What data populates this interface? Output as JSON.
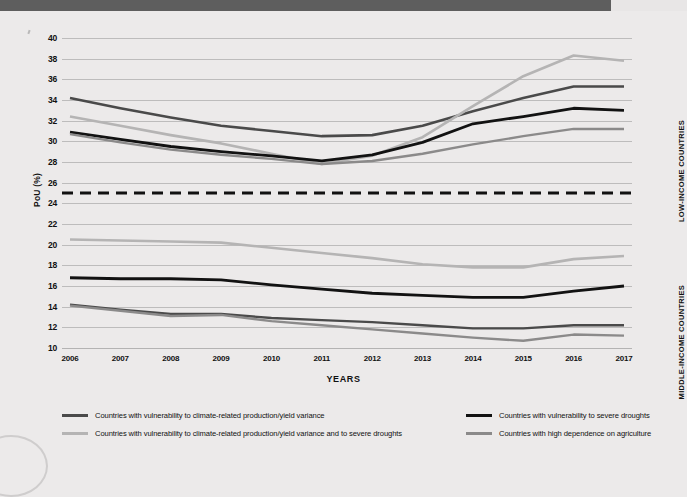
{
  "banner": {
    "color": "#5e5e5e",
    "width_px": 611
  },
  "axes": {
    "ylabel": "PoU (%)",
    "xlabel": "YEARS",
    "yticks": [
      10,
      12,
      14,
      16,
      18,
      20,
      22,
      24,
      26,
      28,
      30,
      32,
      34,
      36,
      38,
      40
    ],
    "ylim": [
      10,
      40
    ],
    "xticks": [
      "2006",
      "2007",
      "2008",
      "2009",
      "2010",
      "2011",
      "2012",
      "2013",
      "2014",
      "2015",
      "2016",
      "2017"
    ]
  },
  "panels": {
    "upper_label": "LOW-INCOME COUNTRIES",
    "lower_label": "MIDDLE-INCOME COUNTRIES",
    "divider_value": 25,
    "divider_style": "dashed"
  },
  "legend": [
    {
      "label": "Countries with vulnerability to climate-related production/yield variance",
      "color": "#4a4a4a",
      "column": "left",
      "row": 1
    },
    {
      "label": "Countries with vulnerability to climate-related production/yield variance and to severe droughts",
      "color": "#b5b4b4",
      "column": "left",
      "row": 2
    },
    {
      "label": "Countries with vulnerability to severe droughts",
      "color": "#121212",
      "column": "right",
      "row": 1
    },
    {
      "label": "Countries with high dependence on agriculture",
      "color": "#8b8a8a",
      "column": "right",
      "row": 2
    }
  ],
  "chart_data": {
    "type": "line",
    "title": "",
    "xlabel": "YEARS",
    "ylabel": "PoU (%)",
    "ylim": [
      10,
      40
    ],
    "grid": true,
    "legend_position": "bottom",
    "x": [
      "2006",
      "2007",
      "2008",
      "2009",
      "2010",
      "2011",
      "2012",
      "2013",
      "2014",
      "2015",
      "2016",
      "2017"
    ],
    "annotations": [
      {
        "text": "LOW-INCOME COUNTRIES",
        "position": "right-upper"
      },
      {
        "text": "MIDDLE-INCOME COUNTRIES",
        "position": "right-lower"
      },
      {
        "text": "dashed reference line",
        "y": 25
      }
    ],
    "series": [
      {
        "name": "Countries with vulnerability to climate-related production/yield variance",
        "group": "LOW-INCOME COUNTRIES",
        "color": "#4a4a4a",
        "width": 2.6,
        "values": [
          34.2,
          33.2,
          32.3,
          31.5,
          31.0,
          30.5,
          30.6,
          31.5,
          32.9,
          34.2,
          35.3,
          35.3
        ]
      },
      {
        "name": "Countries with vulnerability to climate-related production/yield variance and to severe droughts",
        "group": "LOW-INCOME COUNTRIES",
        "color": "#b5b4b4",
        "width": 2.6,
        "values": [
          32.4,
          31.5,
          30.6,
          29.8,
          28.8,
          27.8,
          28.6,
          30.4,
          33.4,
          36.3,
          38.3,
          37.8
        ]
      },
      {
        "name": "Countries with vulnerability to severe droughts",
        "group": "LOW-INCOME COUNTRIES",
        "color": "#121212",
        "width": 2.8,
        "values": [
          30.9,
          30.2,
          29.5,
          29.0,
          28.6,
          28.1,
          28.7,
          29.9,
          31.7,
          32.4,
          33.2,
          33.0
        ]
      },
      {
        "name": "Countries with high dependence on agriculture",
        "group": "LOW-INCOME COUNTRIES",
        "color": "#8b8a8a",
        "width": 2.4,
        "values": [
          30.7,
          29.9,
          29.2,
          28.7,
          28.3,
          27.8,
          28.1,
          28.8,
          29.7,
          30.5,
          31.2,
          31.2
        ]
      },
      {
        "name": "Countries with vulnerability to climate-related production/yield variance",
        "group": "MIDDLE-INCOME COUNTRIES",
        "color": "#4a4a4a",
        "width": 2.4,
        "values": [
          14.2,
          13.7,
          13.3,
          13.3,
          12.9,
          12.7,
          12.5,
          12.2,
          11.9,
          11.9,
          12.2,
          12.2
        ]
      },
      {
        "name": "Countries with vulnerability to climate-related production/yield variance and to severe droughts",
        "group": "MIDDLE-INCOME COUNTRIES",
        "color": "#b5b4b4",
        "width": 2.6,
        "values": [
          20.5,
          20.4,
          20.3,
          20.2,
          19.7,
          19.2,
          18.7,
          18.1,
          17.8,
          17.8,
          18.6,
          18.9
        ]
      },
      {
        "name": "Countries with vulnerability to severe droughts",
        "group": "MIDDLE-INCOME COUNTRIES",
        "color": "#121212",
        "width": 2.8,
        "values": [
          16.8,
          16.7,
          16.7,
          16.6,
          16.1,
          15.7,
          15.3,
          15.1,
          14.9,
          14.9,
          15.5,
          16.0
        ]
      },
      {
        "name": "Countries with high dependence on agriculture",
        "group": "MIDDLE-INCOME COUNTRIES",
        "color": "#8b8a8a",
        "width": 2.4,
        "values": [
          14.1,
          13.6,
          13.1,
          13.2,
          12.6,
          12.2,
          11.8,
          11.4,
          11.0,
          10.7,
          11.3,
          11.2
        ]
      }
    ]
  }
}
